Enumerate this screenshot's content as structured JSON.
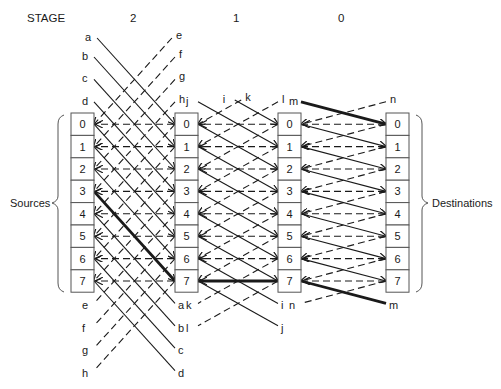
{
  "header": {
    "stage_label": "STAGE",
    "stages": [
      "2",
      "1",
      "0"
    ]
  },
  "side_labels": {
    "left": "Sources",
    "right": "Destinations"
  },
  "columns": [
    {
      "name": "sources",
      "cells": [
        "0",
        "1",
        "2",
        "3",
        "4",
        "5",
        "6",
        "7"
      ]
    },
    {
      "name": "after-stage-2",
      "cells": [
        "0",
        "1",
        "2",
        "3",
        "4",
        "5",
        "6",
        "7"
      ]
    },
    {
      "name": "after-stage-1",
      "cells": [
        "0",
        "1",
        "2",
        "3",
        "4",
        "5",
        "6",
        "7"
      ]
    },
    {
      "name": "destinations",
      "cells": [
        "0",
        "1",
        "2",
        "3",
        "4",
        "5",
        "6",
        "7"
      ]
    }
  ],
  "stages_wiring": [
    {
      "stage": "2",
      "shift": 4,
      "solid_labels": [
        "a",
        "b",
        "c",
        "d"
      ],
      "dashed_labels": [
        "e",
        "f",
        "g",
        "h"
      ]
    },
    {
      "stage": "1",
      "shift": 2,
      "solid_labels": [
        "i",
        "j"
      ],
      "dashed_labels": [
        "k",
        "l"
      ]
    },
    {
      "stage": "0",
      "shift": 1,
      "solid_labels": [
        "m"
      ],
      "dashed_labels": [
        "n"
      ]
    }
  ],
  "highlighted_path": {
    "description": "Source 3 to destination 0",
    "hops": [
      "source 3",
      "stage-2 col 7",
      "stage-1 col 7",
      "wrap m",
      "destination 0"
    ]
  },
  "colors": {
    "line": "#1a1a1a",
    "box_border": "#555555",
    "background": "#ffffff"
  }
}
